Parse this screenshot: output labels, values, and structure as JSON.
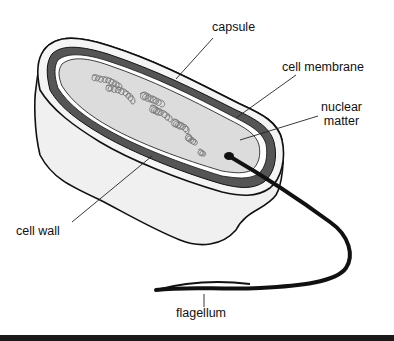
{
  "labels": {
    "capsule": "capsule",
    "cell_membrane": "cell membrane",
    "nuclear_matter_line1": "nuclear",
    "nuclear_matter_line2": "matter",
    "cell_wall": "cell wall",
    "flagellum": "flagellum"
  },
  "colors": {
    "capsule_fill": "#f0f0f0",
    "cell_wall_fill": "#555555",
    "cytoplasm_fill": "#dcdcdc",
    "dna_stroke": "#7a7a7a",
    "outline": "#111111"
  }
}
